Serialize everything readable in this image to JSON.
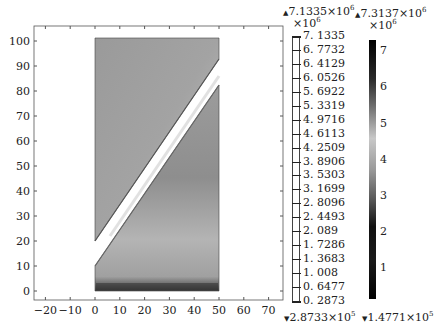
{
  "chart_data": {
    "type": "heatmap",
    "title": "",
    "xlabel": "",
    "ylabel": "",
    "xlim": [
      -25,
      75
    ],
    "ylim": [
      -5,
      105
    ],
    "x_ticks": [
      -20,
      -10,
      0,
      10,
      20,
      30,
      40,
      50,
      60,
      70
    ],
    "y_ticks": [
      0,
      10,
      20,
      30,
      40,
      50,
      60,
      70,
      80,
      90,
      100
    ],
    "grid": false,
    "domain": {
      "x": [
        0,
        50
      ],
      "y": [
        0,
        101
      ]
    },
    "slot": {
      "lower_left": [
        0,
        10
      ],
      "upper_left": [
        0,
        20
      ],
      "lower_right": [
        50,
        82
      ],
      "upper_right": [
        50,
        92
      ]
    },
    "colorbar_1": {
      "type": "contour-levels",
      "max_label": "7.1335×10",
      "max_exp": "6",
      "min_label": "2.8733×10",
      "min_exp": "5",
      "scale_label": "×10",
      "scale_exp": "6",
      "levels": [
        "7.1335",
        "6.7732",
        "6.4129",
        "6.0526",
        "5.6922",
        "5.3319",
        "4.9716",
        "4.6113",
        "4.2509",
        "3.8906",
        "3.5303",
        "3.1699",
        "2.8096",
        "2.4493",
        "2.089",
        "1.7286",
        "1.3683",
        "1.008",
        "0.6477",
        "0.2873"
      ]
    },
    "colorbar_2": {
      "type": "continuous",
      "max_label": "7.3137×10",
      "max_exp": "6",
      "min_label": "1.4771×10",
      "min_exp": "5",
      "scale_label": "×10",
      "scale_exp": "6",
      "ticks": [
        "7",
        "6",
        "5",
        "4",
        "3",
        "2",
        "1"
      ]
    }
  }
}
